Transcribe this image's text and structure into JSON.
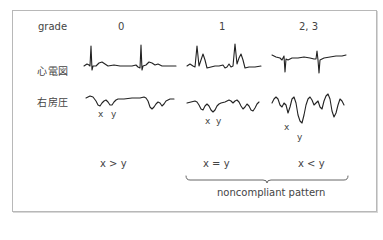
{
  "figure": {
    "header_label": "grade",
    "grades": [
      "0",
      "1",
      "2, 3"
    ],
    "row_labels": {
      "ecg": "心電図",
      "ra_pressure": "右房圧"
    },
    "wave_markers": {
      "grade0": {
        "x": "x",
        "y": "y"
      },
      "grade1": {
        "x": "x",
        "y": "y"
      },
      "grade23": {
        "x": "x",
        "y": "y"
      }
    },
    "relations": [
      "x > y",
      "x = y",
      "x < y"
    ],
    "bracket_label": "noncompliant pattern"
  },
  "colors": {
    "line": "#222222",
    "text": "#444444",
    "frame": "#b8b8b8",
    "background": "#ffffff"
  }
}
